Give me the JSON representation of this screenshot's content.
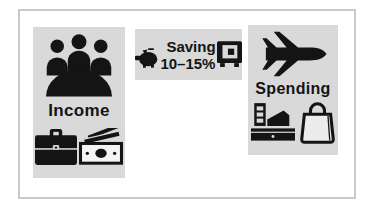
{
  "figure": {
    "panels": {
      "income": {
        "label": "Income"
      },
      "saving": {
        "line1": "Saving",
        "line2": "10–15%"
      },
      "spending": {
        "label": "Spending"
      }
    },
    "icons": {
      "income_top": "meeting-people-icon",
      "income_bottom_left": "briefcase-icon",
      "income_bottom_right": "banknotes-icon",
      "saving_left": "piggy-bank-icon",
      "saving_right": "safe-icon",
      "spending_top": "airplane-icon",
      "spending_bottom_left": "cash-register-icon",
      "spending_bottom_right": "shopping-bag-icon"
    },
    "colors": {
      "background": "#ffffff",
      "frame_border": "#c9c9c9",
      "panel_bg": "#d9d9d9",
      "ink": "#141414"
    }
  }
}
